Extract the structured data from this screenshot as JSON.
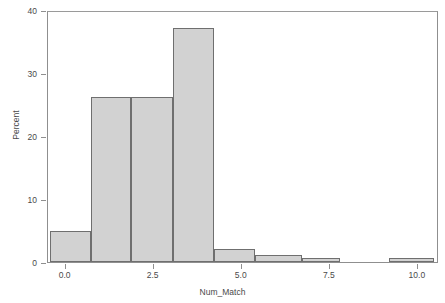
{
  "chart_data": {
    "type": "bar",
    "chart_subtype": "histogram",
    "title": "",
    "subtitle": "",
    "xlabel": "Num_Match",
    "ylabel": "Percent",
    "xlim": [
      -0.5,
      10.6
    ],
    "ylim": [
      0,
      40
    ],
    "grid": false,
    "legend": null,
    "legend_position": "none",
    "xticks": [
      "0.0",
      "2.5",
      "5.0",
      "7.5",
      "10.0"
    ],
    "xtick_values": [
      0.0,
      2.5,
      5.0,
      7.5,
      10.0
    ],
    "yticks": [
      "0",
      "10",
      "20",
      "30",
      "40"
    ],
    "ytick_values": [
      0,
      10,
      20,
      30,
      40
    ],
    "bin_width": 1.17,
    "bins": [
      {
        "left": -0.45,
        "right": 0.72,
        "value": 4.9
      },
      {
        "left": 0.72,
        "right": 1.87,
        "value": 26.2
      },
      {
        "left": 1.87,
        "right": 3.04,
        "value": 26.2
      },
      {
        "left": 3.04,
        "right": 4.21,
        "value": 37.1
      },
      {
        "left": 4.21,
        "right": 5.37,
        "value": 2.0
      },
      {
        "left": 5.37,
        "right": 6.71,
        "value": 1.1
      },
      {
        "left": 6.71,
        "right": 7.78,
        "value": 0.6
      },
      {
        "left": 9.18,
        "right": 10.45,
        "value": 0.6
      }
    ],
    "categories": [
      "0",
      "1",
      "2",
      "3",
      "4",
      "5",
      "6",
      "9"
    ],
    "values": [
      4.9,
      26.2,
      26.2,
      37.1,
      2.0,
      1.1,
      0.6,
      0.6
    ],
    "colors": {
      "bar_fill": "#d2d2d2",
      "bar_border": "#6f6f6f",
      "frame": "#8f8f8f",
      "text": "#4a4a4a",
      "background": "#ffffff"
    }
  },
  "axes": {
    "x_label": "Num_Match",
    "y_label": "Percent"
  }
}
